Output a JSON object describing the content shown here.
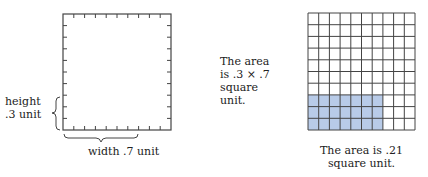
{
  "left_figure": {
    "height_label": "height",
    "height_value": ".3 unit",
    "width_label": "width .7 unit",
    "ticks_x": 10,
    "ticks_y": 10
  },
  "middle_text": {
    "line1": "The area",
    "line2": "is .3 × .7",
    "line3": "square",
    "line4": "unit."
  },
  "right_figure": {
    "rows": 10,
    "cols": 10,
    "shaded_rows": 3,
    "shaded_cols": 7,
    "shade_color": "#b8cbe8",
    "caption_line1": "The area is .21",
    "caption_line2": "square unit."
  }
}
